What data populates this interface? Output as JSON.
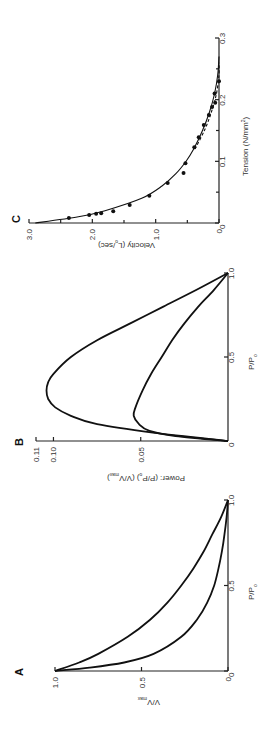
{
  "figure": {
    "orientation": "rotated-90-ccw"
  },
  "chart_data": [
    {
      "panel": "A",
      "type": "line",
      "title": "",
      "xlabel": "P/P0",
      "ylabel": "V/Vmax",
      "xlim": [
        0,
        1.0
      ],
      "ylim": [
        0,
        1.0
      ],
      "xticks": [
        "0",
        "0.5",
        "1.0"
      ],
      "yticks": [
        "0",
        "0.5",
        "1.0"
      ],
      "series": [
        {
          "name": "upper curve",
          "x": [
            0,
            0.05,
            0.1,
            0.2,
            0.3,
            0.4,
            0.5,
            0.6,
            0.7,
            0.8,
            0.9,
            1.0
          ],
          "y": [
            1.0,
            0.86,
            0.75,
            0.58,
            0.45,
            0.35,
            0.27,
            0.2,
            0.14,
            0.09,
            0.04,
            0
          ]
        },
        {
          "name": "lower curve",
          "x": [
            0,
            0.02,
            0.05,
            0.1,
            0.2,
            0.3,
            0.4,
            0.5,
            0.6,
            0.7,
            0.8,
            0.9,
            1.0
          ],
          "y": [
            1.0,
            0.8,
            0.6,
            0.43,
            0.27,
            0.18,
            0.12,
            0.08,
            0.055,
            0.035,
            0.02,
            0.008,
            0
          ]
        }
      ],
      "grid": false
    },
    {
      "panel": "B",
      "type": "line",
      "title": "",
      "xlabel": "P/P0",
      "ylabel": "Power: (P/P0) (V/Vmax)",
      "xlim": [
        0,
        1.0
      ],
      "ylim": [
        0,
        0.11
      ],
      "xticks": [
        "0",
        "0.5",
        "1.0"
      ],
      "yticks": [
        "0.05",
        "0.10",
        "0.11"
      ],
      "series": [
        {
          "name": "upper curve",
          "x": [
            0,
            0.05,
            0.1,
            0.15,
            0.2,
            0.25,
            0.3,
            0.35,
            0.4,
            0.5,
            0.6,
            0.7,
            0.8,
            0.9,
            1.0
          ],
          "y": [
            0,
            0.043,
            0.075,
            0.09,
            0.099,
            0.103,
            0.104,
            0.103,
            0.1,
            0.09,
            0.075,
            0.056,
            0.037,
            0.018,
            0
          ]
        },
        {
          "name": "lower curve",
          "x": [
            0,
            0.03,
            0.06,
            0.1,
            0.15,
            0.2,
            0.3,
            0.4,
            0.5,
            0.6,
            0.7,
            0.8,
            0.9,
            1.0
          ],
          "y": [
            0,
            0.03,
            0.045,
            0.051,
            0.054,
            0.053,
            0.049,
            0.044,
            0.038,
            0.032,
            0.025,
            0.017,
            0.008,
            0
          ]
        }
      ],
      "grid": false
    },
    {
      "panel": "C",
      "type": "scatter",
      "title": "",
      "xlabel": "Tension (N/mm²)",
      "ylabel": "Velocity (L0/sec)",
      "xlim": [
        0,
        0.3
      ],
      "ylim": [
        0,
        3.0
      ],
      "xticks": [
        "0",
        "0.1",
        "0.2",
        "0.3"
      ],
      "yticks": [
        "0",
        "1.0",
        "2.0",
        "3.0"
      ],
      "points": {
        "x": [
          0.008,
          0.013,
          0.015,
          0.016,
          0.019,
          0.029,
          0.044,
          0.065,
          0.081,
          0.097,
          0.123,
          0.139,
          0.159,
          0.175,
          0.188,
          0.195,
          0.21,
          0.23
        ],
        "y": [
          2.37,
          2.05,
          1.94,
          1.86,
          1.67,
          1.41,
          1.1,
          0.81,
          0.56,
          0.53,
          0.39,
          0.32,
          0.24,
          0.16,
          0.11,
          0.06,
          0.07,
          0.0
        ]
      },
      "series": [
        {
          "name": "fit curve solid",
          "x": [
            0,
            0.01,
            0.02,
            0.04,
            0.06,
            0.08,
            0.1,
            0.12,
            0.15,
            0.18,
            0.21,
            0.24,
            0.27
          ],
          "y": [
            2.9,
            2.22,
            1.8,
            1.22,
            0.9,
            0.68,
            0.52,
            0.4,
            0.26,
            0.15,
            0.07,
            0.02,
            0
          ]
        },
        {
          "name": "fit curve dashed",
          "x": [
            0.12,
            0.15,
            0.18,
            0.21,
            0.24,
            0.26
          ],
          "y": [
            0.38,
            0.23,
            0.12,
            0.04,
            0.0,
            0.0
          ]
        }
      ],
      "grid": false
    }
  ],
  "labels": {
    "A": {
      "letter": "A",
      "xlabel": "P/P",
      "xlabel_sub": "o",
      "ylabel": "V/V",
      "ylabel_sub": "max"
    },
    "B": {
      "letter": "B",
      "xlabel": "P/P",
      "xlabel_sub": "o",
      "ylabel_main": "Power:  (P/P",
      "ylabel_sub1": "o",
      "ylabel_mid": ")  (V/V",
      "ylabel_sub2": "max",
      "ylabel_end": ")"
    },
    "C": {
      "letter": "C",
      "xlabel": "Tension (N/mm",
      "xlabel_sup": "2",
      "xlabel_end": ")",
      "ylabel": "Velocity (L",
      "ylabel_sub": "o",
      "ylabel_end": "/sec)"
    }
  }
}
